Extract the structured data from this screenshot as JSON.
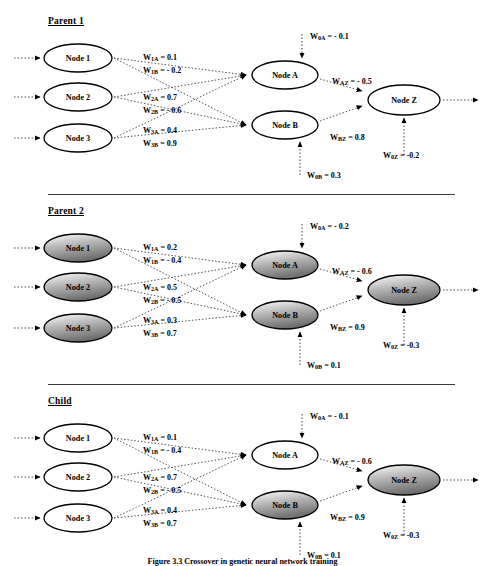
{
  "figure": {
    "caption": "Figure 3.3   Crossover in genetic neural network training",
    "width": 485,
    "height": 566
  },
  "colors": {
    "stroke": "#000000",
    "dotted": "#555555",
    "shade_light": "#ffffff",
    "shade_dark": "#6f6f6f",
    "divider": "#3a3a3a"
  },
  "sections": [
    {
      "id": "parent1",
      "title": "Parent 1",
      "top": 0,
      "divider": false,
      "nodes": {
        "input": [
          {
            "label": "Node 1",
            "shaded": false
          },
          {
            "label": "Node 2",
            "shaded": false
          },
          {
            "label": "Node 3",
            "shaded": false
          }
        ],
        "hidden": [
          {
            "label": "Node A",
            "shaded": false
          },
          {
            "label": "Node B",
            "shaded": false
          }
        ],
        "output": {
          "label": "Node Z",
          "shaded": false
        }
      },
      "weights": {
        "w1a": {
          "sym": "W",
          "sub": "1A",
          "value": "= 0.1"
        },
        "w1b": {
          "sym": "W",
          "sub": "1B",
          "value": "= - 0.2"
        },
        "w2a": {
          "sym": "W",
          "sub": "2A",
          "value": "= 0.7"
        },
        "w2b": {
          "sym": "W",
          "sub": "2B",
          "value": "= - 0.6"
        },
        "w3a": {
          "sym": "W",
          "sub": "3A",
          "value": "= 0.4"
        },
        "w3b": {
          "sym": "W",
          "sub": "3B",
          "value": "= 0.9"
        },
        "w0a": {
          "sym": "W",
          "sub": "0A",
          "value": "= - 0.1"
        },
        "w0b": {
          "sym": "W",
          "sub": "0B",
          "value": "= 0.3"
        },
        "waz": {
          "sym": "W",
          "sub": "AZ",
          "value": "= - 0.5"
        },
        "wbz": {
          "sym": "W",
          "sub": "BZ",
          "value": "= 0.8"
        },
        "w0z": {
          "sym": "W",
          "sub": "0Z",
          "value": "= -0.2"
        }
      }
    },
    {
      "id": "parent2",
      "title": "Parent 2",
      "top": 190,
      "divider": true,
      "nodes": {
        "input": [
          {
            "label": "Node 1",
            "shaded": true
          },
          {
            "label": "Node 2",
            "shaded": true
          },
          {
            "label": "Node 3",
            "shaded": true
          }
        ],
        "hidden": [
          {
            "label": "Node A",
            "shaded": true
          },
          {
            "label": "Node B",
            "shaded": true
          }
        ],
        "output": {
          "label": "Node Z",
          "shaded": true
        }
      },
      "weights": {
        "w1a": {
          "sym": "W",
          "sub": "1A",
          "value": "= 0.2"
        },
        "w1b": {
          "sym": "W",
          "sub": "1B",
          "value": "= - 0.4"
        },
        "w2a": {
          "sym": "W",
          "sub": "2A",
          "value": "= 0.5"
        },
        "w2b": {
          "sym": "W",
          "sub": "2B",
          "value": "= - 0.5"
        },
        "w3a": {
          "sym": "W",
          "sub": "3A",
          "value": "= 0.3"
        },
        "w3b": {
          "sym": "W",
          "sub": "3B",
          "value": "= 0.7"
        },
        "w0a": {
          "sym": "W",
          "sub": "0A",
          "value": "= - 0.2"
        },
        "w0b": {
          "sym": "W",
          "sub": "0B",
          "value": "= 0.1"
        },
        "waz": {
          "sym": "W",
          "sub": "AZ",
          "value": "= - 0.6"
        },
        "wbz": {
          "sym": "W",
          "sub": "BZ",
          "value": "= 0.9"
        },
        "w0z": {
          "sym": "W",
          "sub": "0Z",
          "value": "= -0.3"
        }
      }
    },
    {
      "id": "child",
      "title": "Child",
      "top": 380,
      "divider": true,
      "nodes": {
        "input": [
          {
            "label": "Node 1",
            "shaded": false
          },
          {
            "label": "Node 2",
            "shaded": false
          },
          {
            "label": "Node 3",
            "shaded": false
          }
        ],
        "hidden": [
          {
            "label": "Node A",
            "shaded": false
          },
          {
            "label": "Node B",
            "shaded": true
          }
        ],
        "output": {
          "label": "Node Z",
          "shaded": true
        }
      },
      "weights": {
        "w1a": {
          "sym": "W",
          "sub": "1A",
          "value": "= 0.1"
        },
        "w1b": {
          "sym": "W",
          "sub": "1B",
          "value": "= - 0.4"
        },
        "w2a": {
          "sym": "W",
          "sub": "2A",
          "value": "= 0.7"
        },
        "w2b": {
          "sym": "W",
          "sub": "2B",
          "value": "= - 0.5"
        },
        "w3a": {
          "sym": "W",
          "sub": "3A",
          "value": "= 0.4"
        },
        "w3b": {
          "sym": "W",
          "sub": "3B",
          "value": "= 0.7"
        },
        "w0a": {
          "sym": "W",
          "sub": "0A",
          "value": "= - 0.1"
        },
        "w0b": {
          "sym": "W",
          "sub": "0B",
          "value": "= 0.1"
        },
        "waz": {
          "sym": "W",
          "sub": "AZ",
          "value": "= - 0.6"
        },
        "wbz": {
          "sym": "W",
          "sub": "BZ",
          "value": "= 0.9"
        },
        "w0z": {
          "sym": "W",
          "sub": "0Z",
          "value": "= -0.3"
        }
      }
    }
  ],
  "geometry": {
    "input_x": 78,
    "input_rx": 34,
    "input_ry": 14,
    "input_ys": [
      58,
      97,
      138
    ],
    "hidden_x": 285,
    "hidden_rx": 33,
    "hidden_ry": 14,
    "hidden_ys": [
      75,
      125
    ],
    "output_x": 404,
    "output_rx": 36,
    "output_ry": 15,
    "output_y": 100
  }
}
